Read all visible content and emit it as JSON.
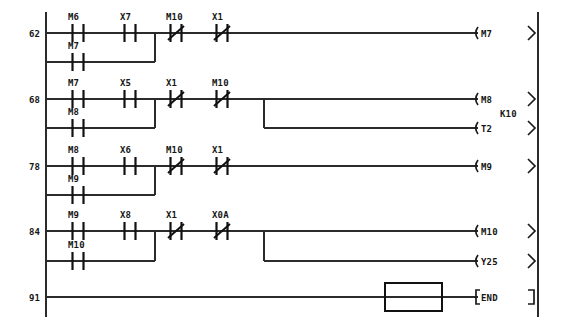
{
  "diagram": {
    "kind": "plc-ladder-logic",
    "left_rail_x": 46,
    "right_rail_x": 538,
    "colors": {
      "wire": "#2b2b2b",
      "symbol": "#111111",
      "text": "#161616",
      "background": "#ffffff"
    },
    "rungs": [
      {
        "step": "62",
        "y": 33,
        "contacts": [
          {
            "label": "M6",
            "type": "no",
            "x": 78
          },
          {
            "label": "X7",
            "type": "no",
            "x": 130
          },
          {
            "label": "M10",
            "type": "nc",
            "x": 176
          },
          {
            "label": "X1",
            "type": "nc",
            "x": 222
          }
        ],
        "branch": {
          "y": 62,
          "label": "M7",
          "type": "no",
          "x": 78,
          "join_x": 155
        },
        "coils": [
          {
            "label": "M7",
            "y": 33,
            "preset": null
          }
        ]
      },
      {
        "step": "68",
        "y": 99,
        "contacts": [
          {
            "label": "M7",
            "type": "no",
            "x": 78
          },
          {
            "label": "X5",
            "type": "no",
            "x": 130
          },
          {
            "label": "X1",
            "type": "nc",
            "x": 176
          },
          {
            "label": "M10",
            "type": "nc",
            "x": 222
          }
        ],
        "branch": {
          "y": 128,
          "label": "M8",
          "type": "no",
          "x": 78,
          "join_x": 155
        },
        "drop": {
          "x": 264,
          "from_y": 99,
          "to_y": 128
        },
        "coils": [
          {
            "label": "M8",
            "y": 99,
            "preset": null
          },
          {
            "label": "T2",
            "y": 128,
            "preset": "K10"
          }
        ]
      },
      {
        "step": "78",
        "y": 166,
        "contacts": [
          {
            "label": "M8",
            "type": "no",
            "x": 78
          },
          {
            "label": "X6",
            "type": "no",
            "x": 130
          },
          {
            "label": "M10",
            "type": "nc",
            "x": 176
          },
          {
            "label": "X1",
            "type": "nc",
            "x": 222
          }
        ],
        "branch": {
          "y": 195,
          "label": "M9",
          "type": "no",
          "x": 78,
          "join_x": 155
        },
        "coils": [
          {
            "label": "M9",
            "y": 166,
            "preset": null
          }
        ]
      },
      {
        "step": "84",
        "y": 231,
        "contacts": [
          {
            "label": "M9",
            "type": "no",
            "x": 78
          },
          {
            "label": "X8",
            "type": "no",
            "x": 130
          },
          {
            "label": "X1",
            "type": "nc",
            "x": 176
          },
          {
            "label": "X0A",
            "type": "nc",
            "x": 222
          }
        ],
        "branch": {
          "y": 261,
          "label": "M10",
          "type": "no",
          "x": 78,
          "join_x": 155
        },
        "drop": {
          "x": 264,
          "from_y": 231,
          "to_y": 261
        },
        "coils": [
          {
            "label": "M10",
            "y": 231,
            "preset": null
          },
          {
            "label": "Y25",
            "y": 261,
            "preset": null
          }
        ]
      },
      {
        "step": "91",
        "y": 297,
        "contacts": [],
        "branch": null,
        "coils": [],
        "instruction": {
          "label": "END",
          "y": 297
        },
        "cursor_box": {
          "x": 385,
          "y": 283,
          "width": 57,
          "height": 28
        }
      }
    ]
  }
}
